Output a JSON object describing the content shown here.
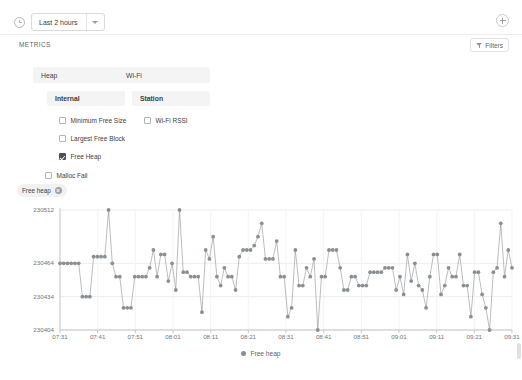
{
  "topbar": {
    "clock_icon": "clock-icon",
    "time_range_value": "Last 2 hours",
    "caret_icon": "chevron-down-icon",
    "add_icon": "plus-circle-icon"
  },
  "metrics_header": {
    "title": "METRICS",
    "filters_label": "Filters",
    "filter_icon": "funnel-icon"
  },
  "tree": {
    "groups": [
      {
        "name": "Heap",
        "subgroups": [
          {
            "name": "Internal",
            "items": [
              {
                "label": "Minimum Free Size",
                "checked": false
              },
              {
                "label": "Largest Free Block",
                "checked": false
              },
              {
                "label": "Free Heap",
                "checked": true
              }
            ]
          }
        ],
        "loose_items": [
          {
            "label": "Malloc Fail",
            "checked": false
          }
        ]
      },
      {
        "name": "Wi-Fi",
        "subgroups": [
          {
            "name": "Station",
            "items": [
              {
                "label": "Wi-Fi RSSI",
                "checked": false
              }
            ]
          }
        ],
        "loose_items": []
      }
    ]
  },
  "chip": {
    "label": "Free heap",
    "remove_icon": "close-circle-icon"
  },
  "chart_data": {
    "type": "line",
    "title": "",
    "xlabel": "",
    "ylabel": "",
    "grid": true,
    "legend_position": "bottom",
    "marker": "circle",
    "series_color": "#8a8f94",
    "y_ticks": [
      230404,
      230434,
      230464,
      230512
    ],
    "ylim": [
      230404,
      230512
    ],
    "x_ticks": [
      "07:31",
      "07:41",
      "07:51",
      "08:01",
      "08:11",
      "08:21",
      "08:31",
      "08:41",
      "08:51",
      "09:01",
      "09:11",
      "09:21",
      "09:31"
    ],
    "series": [
      {
        "name": "Free heap",
        "values": [
          230464,
          230464,
          230464,
          230464,
          230464,
          230464,
          230434,
          230434,
          230434,
          230470,
          230470,
          230470,
          230470,
          230512,
          230464,
          230452,
          230452,
          230424,
          230424,
          230424,
          230452,
          230452,
          230452,
          230452,
          230460,
          230476,
          230452,
          230472,
          230472,
          230448,
          230464,
          230440,
          230512,
          230456,
          230456,
          230452,
          230452,
          230452,
          230420,
          230476,
          230468,
          230488,
          230452,
          230444,
          230460,
          230452,
          230452,
          230440,
          230470,
          230476,
          230476,
          230476,
          230480,
          230488,
          230500,
          230468,
          230468,
          230468,
          230484,
          230452,
          230452,
          230416,
          230424,
          230476,
          230444,
          230444,
          230460,
          230452,
          230468,
          230404,
          230452,
          230452,
          230476,
          230476,
          230476,
          230460,
          230440,
          230440,
          230452,
          230452,
          230444,
          230444,
          230444,
          230456,
          230456,
          230456,
          230456,
          230460,
          230460,
          230460,
          230440,
          230452,
          230436,
          230472,
          230448,
          230464,
          230444,
          230440,
          230424,
          230452,
          230472,
          230472,
          230436,
          230444,
          230460,
          230452,
          230452,
          230472,
          230444,
          230444,
          230416,
          230456,
          230456,
          230436,
          230424,
          230404,
          230456,
          230460,
          230500,
          230452,
          230476,
          230460
        ]
      }
    ]
  },
  "legend": {
    "label": "Free heap"
  }
}
